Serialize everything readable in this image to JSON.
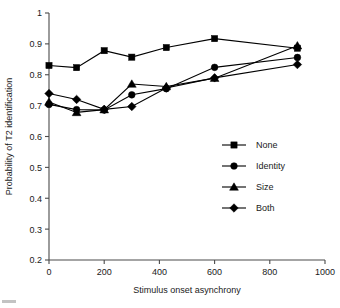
{
  "chart_data": {
    "type": "line",
    "title": "",
    "xlabel": "Stimulus onset asynchrony",
    "ylabel": "Probability of T2 identification",
    "xlim": [
      0,
      1000
    ],
    "ylim": [
      0.2,
      1
    ],
    "xticks": [
      0,
      200,
      400,
      600,
      800,
      1000
    ],
    "xtick_labels": [
      "0",
      "200",
      "400",
      "600",
      "800",
      "1000"
    ],
    "yticks": [
      0.2,
      0.3,
      0.4,
      0.5,
      0.6,
      0.7,
      0.8,
      0.9,
      1
    ],
    "ytick_labels": [
      "0.2",
      "0.3",
      "0.4",
      "0.5",
      "0.6",
      "0.7",
      "0.8",
      "0.9",
      "1"
    ],
    "grid": false,
    "legend_position": "center-right",
    "x": [
      0,
      100,
      200,
      300,
      425,
      600,
      900
    ],
    "series": [
      {
        "name": "None",
        "marker": "square",
        "values": [
          0.83,
          0.823,
          0.878,
          0.857,
          0.888,
          0.917,
          0.886
        ]
      },
      {
        "name": "Identity",
        "marker": "circle",
        "values": [
          0.704,
          0.687,
          0.686,
          0.735,
          0.755,
          0.824,
          0.856
        ]
      },
      {
        "name": "Size",
        "marker": "triangle",
        "values": [
          0.712,
          0.678,
          0.687,
          0.77,
          0.762,
          0.789,
          0.894
        ]
      },
      {
        "name": "Both",
        "marker": "diamond",
        "values": [
          0.739,
          0.72,
          0.688,
          0.697,
          0.757,
          0.79,
          0.833
        ]
      }
    ]
  },
  "legend": {
    "items": [
      {
        "label": "None",
        "marker": "square"
      },
      {
        "label": "Identity",
        "marker": "circle"
      },
      {
        "label": "Size",
        "marker": "triangle"
      },
      {
        "label": "Both",
        "marker": "diamond"
      }
    ]
  }
}
